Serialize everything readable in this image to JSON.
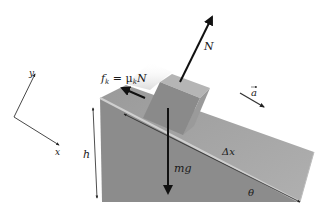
{
  "diagram": {
    "colors": {
      "background": "#ffffff",
      "wedge_front": "#8e8e8e",
      "wedge_top": "#a9a9a9",
      "wedge_edge": "#c8c8c8",
      "block_front": "#8a8a8a",
      "block_top": "#b4b4b4",
      "block_side": "#9c9c9c",
      "arrow": "#111111"
    },
    "axes": {
      "x_label": "x",
      "y_label": "y"
    },
    "labels": {
      "normal_force": "N",
      "friction_f": "f",
      "friction_sub": "k",
      "friction_eq": " = μ",
      "friction_mu_sub": "k",
      "friction_N": "N",
      "weight": "mg",
      "acceleration": "a",
      "displacement": "Δx",
      "height": "h",
      "angle": "θ"
    }
  }
}
